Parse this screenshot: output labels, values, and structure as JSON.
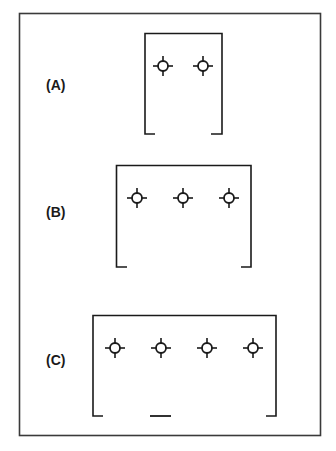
{
  "diagram": {
    "type": "fixture-layout",
    "panels": [
      {
        "id": "A",
        "label": "(A)",
        "fixture_count": 2,
        "width_class": "narrow",
        "has_center_dash": false
      },
      {
        "id": "B",
        "label": "(B)",
        "fixture_count": 3,
        "width_class": "medium",
        "has_center_dash": false
      },
      {
        "id": "C",
        "label": "(C)",
        "fixture_count": 4,
        "width_class": "wide",
        "has_center_dash": true
      }
    ],
    "fixture_icon": "crosshair-circle-icon",
    "colors": {
      "line": "#1a1a1a",
      "frame": "#3a3a3a",
      "background": "#ffffff"
    }
  }
}
